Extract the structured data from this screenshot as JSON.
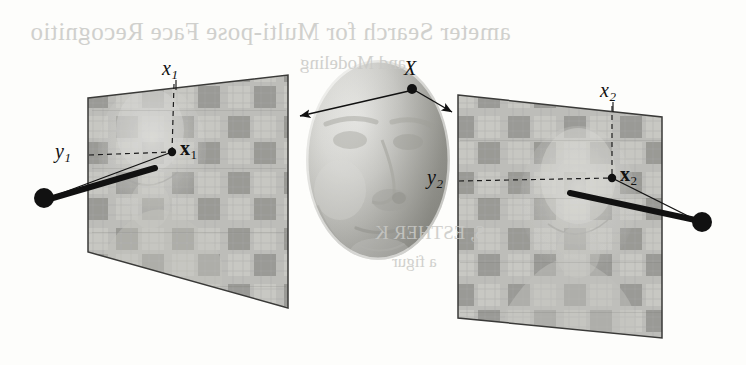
{
  "figure": {
    "caption_present": false,
    "background_color": "#fdfdfb",
    "ink_color": "#111111",
    "width": 746,
    "height": 365
  },
  "labels": {
    "scene_point": {
      "base": "X",
      "sub": ""
    },
    "left_plane_axis_x": {
      "base": "x",
      "sub": "1"
    },
    "left_plane_axis_y": {
      "base": "y",
      "sub": "1"
    },
    "left_image_point": {
      "base": "x",
      "sub": "1"
    },
    "right_plane_axis_x": {
      "base": "x",
      "sub": "2"
    },
    "right_plane_axis_y": {
      "base": "y",
      "sub": "2"
    },
    "right_image_point": {
      "base": "x",
      "sub": "2"
    }
  },
  "bleed_through": {
    "line1": "ameter Search for Multi-pose Face Recognitio",
    "line2": "and Modeling",
    "line3": "S, ESTHER K",
    "line4": "a figur"
  },
  "geometry": {
    "left_plane_corners": [
      [
        88,
        98
      ],
      [
        288,
        75
      ],
      [
        288,
        308
      ],
      [
        88,
        252
      ]
    ],
    "right_plane_corners": [
      [
        458,
        95
      ],
      [
        662,
        117
      ],
      [
        662,
        338
      ],
      [
        458,
        318
      ]
    ],
    "scene_point_xy": [
      412,
      89
    ],
    "left_image_point_xy": [
      172,
      152
    ],
    "right_image_point_xy": [
      612,
      178
    ],
    "left_camera_center_xy": [
      44,
      198
    ],
    "right_camera_center_xy": [
      702,
      222
    ],
    "left_plane_top_tick_xy": [
      176,
      82
    ],
    "right_plane_top_tick_xy": [
      613,
      104
    ]
  },
  "colors": {
    "plane_fill": "#b8b8b4",
    "plane_stroke": "#3a3a38",
    "checker_dark": "#8e8e8a",
    "ink": "#111111",
    "page": "#fdfdfb"
  }
}
